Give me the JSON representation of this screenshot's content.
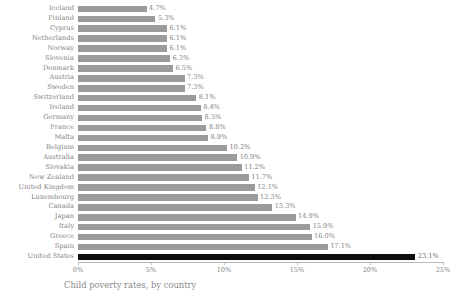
{
  "chart_data": {
    "type": "bar",
    "orientation": "horizontal",
    "title": "",
    "caption": "Child poverty rates, by country",
    "xlabel": "",
    "ylabel": "",
    "xlim": [
      0,
      25
    ],
    "xtick_labels": [
      "0%",
      "5%",
      "10%",
      "15%",
      "20%",
      "25%"
    ],
    "xticks": [
      0,
      5,
      10,
      15,
      20,
      25
    ],
    "grid": false,
    "value_suffix": "%",
    "highlight_category": "United States",
    "colors": {
      "bar": "#9b9b9b",
      "bar_highlight": "#0d0d0d",
      "text": "#7f7f7f",
      "axis": "#b9b9b9",
      "background": "#ffffff"
    },
    "categories": [
      "Iceland",
      "Finland",
      "Cyprus",
      "Netherlands",
      "Norway",
      "Slovenia",
      "Denmark",
      "Austria",
      "Sweden",
      "Switzerland",
      "Ireland",
      "Germany",
      "France",
      "Malta",
      "Belgium",
      "Australia",
      "Slovakia",
      "New Zealand",
      "United Kingdom",
      "Luxembourg",
      "Canada",
      "Japan",
      "Italy",
      "Greece",
      "Spain",
      "United States"
    ],
    "values": [
      4.7,
      5.3,
      6.1,
      6.1,
      6.1,
      6.3,
      6.5,
      7.3,
      7.3,
      8.1,
      8.4,
      8.5,
      8.8,
      8.9,
      10.2,
      10.9,
      11.2,
      11.7,
      12.1,
      12.3,
      13.3,
      14.9,
      15.9,
      16.0,
      17.1,
      23.1
    ],
    "value_labels": [
      "4.7%",
      "5.3%",
      "6.1%",
      "6.1%",
      "6.1%",
      "6.3%",
      "6.5%",
      "7.3%",
      "7.3%",
      "8.1%",
      "8.4%",
      "8.5%",
      "8.8%",
      "8.9%",
      "10.2%",
      "10.9%",
      "11.2%",
      "11.7%",
      "12.1%",
      "12.3%",
      "13.3%",
      "14.9%",
      "15.9%",
      "16.0%",
      "17.1%",
      "23.1%"
    ]
  }
}
